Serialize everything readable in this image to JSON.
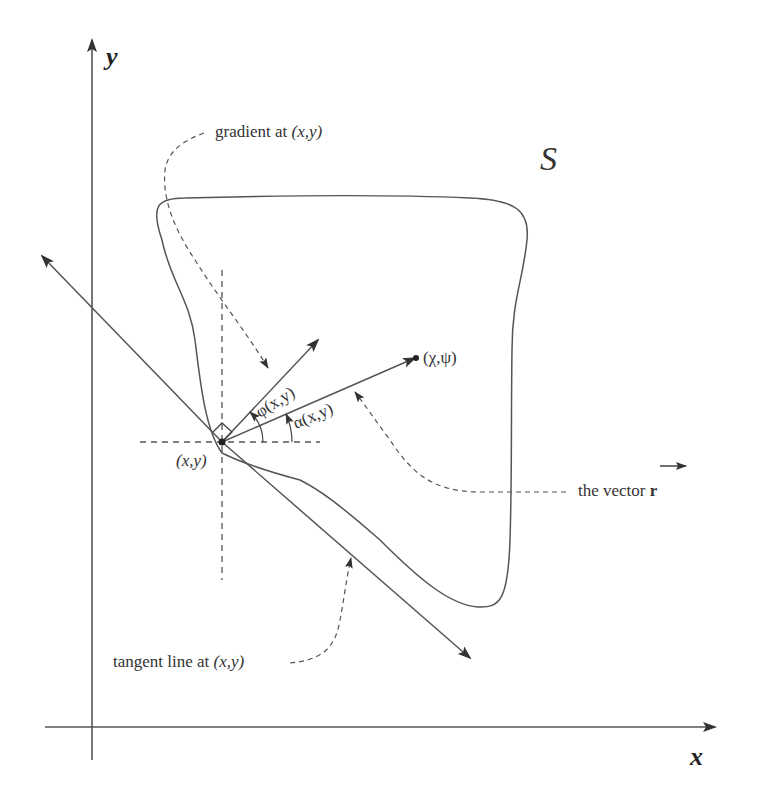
{
  "diagram": {
    "axes": {
      "x_label": "x",
      "y_label": "y"
    },
    "set_label": "S",
    "point_label": "(x,y)",
    "target_point_label": "(χ,ψ)",
    "angle_phi_label": "φ(x,y)",
    "angle_alpha_label": "α(x,y)",
    "annotations": {
      "gradient": {
        "text": "gradient at ",
        "var": "(x,y)"
      },
      "vector": {
        "text": "the vector ",
        "bold": "r"
      },
      "tangent": {
        "text": "tangent line at ",
        "var": "(x,y)"
      }
    },
    "colors": {
      "line": "#555555",
      "text": "#333333",
      "background": "#ffffff"
    }
  }
}
